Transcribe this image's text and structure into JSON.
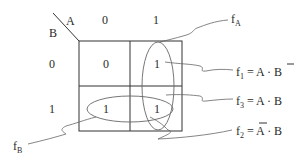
{
  "kmap": {
    "var_col": "A",
    "var_row": "B",
    "col_headers": [
      "0",
      "1"
    ],
    "row_headers": [
      "0",
      "1"
    ],
    "cells": [
      [
        "0",
        "1"
      ],
      [
        "1",
        "1"
      ]
    ]
  },
  "labels": {
    "fA": {
      "base": "f",
      "sub": "A"
    },
    "fB": {
      "base": "f",
      "sub": "B"
    },
    "f1": {
      "base": "f",
      "sub": "1",
      "expr_left": " = A · ",
      "expr_right": "B",
      "bar_on": "B"
    },
    "f3": {
      "base": "f",
      "sub": "3",
      "expr": " = A · B"
    },
    "f2": {
      "base": "f",
      "sub": "2",
      "expr_left": " = ",
      "expr_bar": "A",
      "expr_right": " · B",
      "bar_on": "A"
    }
  },
  "colors": {
    "grid": "#333333",
    "loop": "#666666",
    "text": "#2a2a2a"
  }
}
